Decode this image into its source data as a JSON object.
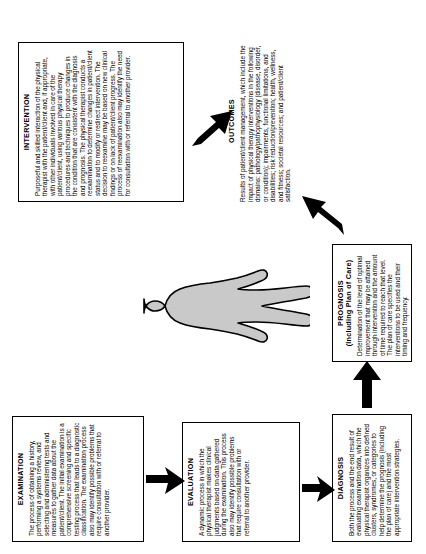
{
  "diagram": {
    "orientation": "rotated-90-ccw",
    "colors": {
      "stroke": "#000000",
      "background": "#ffffff",
      "figure_fill": "#c9c9c9",
      "arrow_fill": "#000000"
    },
    "figure": {
      "label": "patient-client-silhouette"
    },
    "boxes": [
      {
        "id": "examination",
        "title": "EXAMINATION",
        "body": "The process of obtaining a history, performing a systems review, and selecting and administering tests and measures to gather data about the patient/client. The initial examination is a comprehensive screening and specific testing process that leads to a diagnostic classification. The examination process also may identify possible problems that require consultation with or referral to another provider."
      },
      {
        "id": "evaluation",
        "title": "EVALUATION",
        "body": "A dynamic process in which the physical therapist makes clinical judgments based on data gathered during the examination. This process also may identify possible problems that require consultation with or referral to another provider."
      },
      {
        "id": "diagnosis",
        "title": "DIAGNOSIS",
        "body": "Both the process and the end result of evaluating examination data, which the physical therapist organizes into defined clusters, syndromes, or categories to help determine the prognosis (including the plan of care) and the most appropriate intervention strategies."
      },
      {
        "id": "prognosis",
        "title": "PROGNOSIS\n(Including Plan of Care)",
        "body": "Determination of the level of optimal improvement that may be attained through intervention and the amount of time required to reach that level. The plan of care specifies the interventions to be used and their timing and frequency."
      },
      {
        "id": "intervention",
        "title": "INTERVENTION",
        "body": "Purposeful and skilled interaction of the physical therapist with the patient/client and, if appropriate, with other individuals involved in care of the patient/client, using various physical therapy procedures and techniques to produce changes in the condition that are consistent with the diagnosis and prognosis. The physical therapist conducts a reexamination to determine changes in patient/client status and to modify or redirect intervention. The decision to reexamine may be based on new clinical findings or on lack of patient/client progress. The process of reexamination also may identify the need for consultation with or referral to another provider."
      },
      {
        "id": "outcomes",
        "title": "OUTCOMES",
        "body": "Results of patient/client management, which include the impact of physical therapy interventions in the following domains: pathology/pathophysiology (disease, disorder, or condition); impairments, functional limitations, and disabilities; risk reduction/prevention; health, wellness, and fitness; societal resources; and patient/client satisfaction."
      }
    ],
    "arrows": [
      {
        "id": "examination-to-evaluation",
        "from": "examination",
        "to": "evaluation"
      },
      {
        "id": "evaluation-to-diagnosis",
        "from": "evaluation",
        "to": "diagnosis"
      },
      {
        "id": "diagnosis-to-prognosis",
        "from": "diagnosis",
        "to": "prognosis"
      },
      {
        "id": "prognosis-to-intervention",
        "from": "prognosis",
        "to": "intervention"
      },
      {
        "id": "intervention-to-outcomes",
        "from": "intervention",
        "to": "outcomes"
      }
    ]
  }
}
